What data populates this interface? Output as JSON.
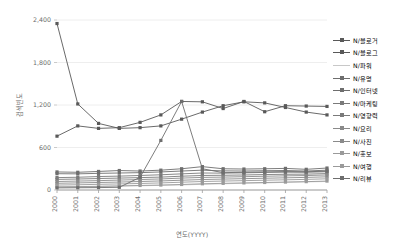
{
  "chart_data": {
    "type": "line",
    "title": "",
    "xlabel": "연도(YYYY)",
    "ylabel": "검색빈도",
    "categories": [
      "2000",
      "2001",
      "2002",
      "2003",
      "2004",
      "2005",
      "2006",
      "2007",
      "2008",
      "2009",
      "2010",
      "2011",
      "2012",
      "2013"
    ],
    "x": [
      2000,
      2001,
      2002,
      2003,
      2004,
      2005,
      2006,
      2007,
      2008,
      2009,
      2010,
      2011,
      2012,
      2013
    ],
    "ylim": [
      0,
      2400
    ],
    "yticks": [
      0,
      600,
      1200,
      1800,
      2400
    ],
    "ytick_labels": [
      "0",
      "600",
      "1,200",
      "1,800",
      "2,400"
    ],
    "grid": true,
    "legend_position": "right",
    "series": [
      {
        "name": "N/블로거",
        "color": "#595959",
        "values": [
          2350,
          1215,
          940,
          870,
          880,
          905,
          1000,
          1100,
          1190,
          1245,
          1230,
          1165,
          1100,
          1060
        ]
      },
      {
        "name": "N/블로그",
        "color": "#595959",
        "values": [
          760,
          905,
          870,
          880,
          955,
          1060,
          1250,
          1245,
          1150,
          1250,
          1105,
          1190,
          1185,
          1180
        ]
      },
      {
        "name": "N/파워",
        "color": "#c8c8c8",
        "values": [
          40,
          45,
          50,
          55,
          60,
          65,
          72,
          80,
          88,
          95,
          100,
          108,
          115,
          120
        ]
      },
      {
        "name": "N/유명",
        "color": "#6e6e6e",
        "values": [
          255,
          250,
          262,
          275,
          268,
          280,
          300,
          330,
          300,
          296,
          300,
          305,
          292,
          310
        ]
      },
      {
        "name": "N/인터넷",
        "color": "#6e6e6e",
        "values": [
          230,
          228,
          235,
          240,
          245,
          255,
          268,
          280,
          270,
          268,
          272,
          275,
          268,
          280
        ]
      },
      {
        "name": "N/마케팅",
        "color": "#7a7a7a",
        "values": [
          175,
          180,
          190,
          196,
          205,
          215,
          228,
          240,
          238,
          242,
          248,
          252,
          250,
          258
        ]
      },
      {
        "name": "N/영향력",
        "color": "#7a7a7a",
        "values": [
          150,
          155,
          162,
          168,
          175,
          182,
          195,
          205,
          208,
          212,
          218,
          222,
          224,
          232
        ]
      },
      {
        "name": "N/요리",
        "color": "#8a8a8a",
        "values": [
          120,
          126,
          132,
          140,
          148,
          156,
          168,
          178,
          182,
          188,
          194,
          200,
          204,
          212
        ]
      },
      {
        "name": "N/사진",
        "color": "#8a8a8a",
        "values": [
          95,
          100,
          106,
          112,
          120,
          128,
          138,
          148,
          154,
          160,
          166,
          172,
          178,
          186
        ]
      },
      {
        "name": "N/홍보",
        "color": "#9a9a9a",
        "values": [
          70,
          74,
          80,
          86,
          92,
          100,
          110,
          120,
          126,
          132,
          138,
          144,
          150,
          158
        ]
      },
      {
        "name": "N/여행",
        "color": "#9a9a9a",
        "values": [
          45,
          48,
          52,
          58,
          64,
          70,
          78,
          88,
          94,
          100,
          106,
          112,
          118,
          126
        ]
      },
      {
        "name": "N/리뷰",
        "color": "#6e6e6e",
        "values": [
          30,
          32,
          34,
          38,
          180,
          700,
          1250,
          300,
          245,
          250,
          255,
          260,
          258,
          265
        ]
      }
    ]
  }
}
